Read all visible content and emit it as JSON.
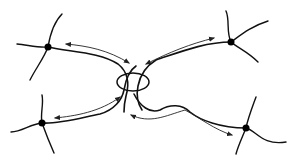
{
  "diagram": {
    "colors": {
      "line": "#111111",
      "arrow": "#222222",
      "node": "#000000",
      "background": "#ffffff"
    },
    "nodes": [
      {
        "id": "top-left",
        "x": 48,
        "y": 47
      },
      {
        "id": "top-right",
        "x": 231,
        "y": 42
      },
      {
        "id": "bottom-left",
        "x": 42,
        "y": 123
      },
      {
        "id": "bottom-right",
        "x": 246,
        "y": 128
      }
    ],
    "center_knot": {
      "cx": 133,
      "cy": 82,
      "rx": 16,
      "ry": 9
    },
    "arrows": [
      {
        "from": "top-left",
        "to": "center",
        "type": "double-headed"
      },
      {
        "from": "top-right",
        "to": "center",
        "type": "double-headed"
      },
      {
        "from": "bottom-left",
        "to": "center",
        "type": "double-headed"
      },
      {
        "from": "bottom-right",
        "to": "center",
        "type": "double-headed"
      }
    ]
  }
}
